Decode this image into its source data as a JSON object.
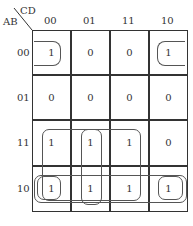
{
  "kmap": {
    "row_var": "AB",
    "col_var": "CD",
    "col_labels": [
      "00",
      "01",
      "11",
      "10"
    ],
    "row_labels": [
      "00",
      "01",
      "11",
      "10"
    ],
    "cells": [
      [
        "1",
        "0",
        "0",
        "1"
      ],
      [
        "0",
        "0",
        "0",
        "0"
      ],
      [
        "1",
        "1",
        "1",
        "0"
      ],
      [
        "1",
        "1",
        "1",
        "1"
      ]
    ],
    "groups": [
      "corner-pair row00 (cols 00,10)",
      "block rows 11-10 cols 00-11",
      "column 01 rows 11-10",
      "row 10 full",
      "row 10 corner cols 00,10"
    ]
  }
}
